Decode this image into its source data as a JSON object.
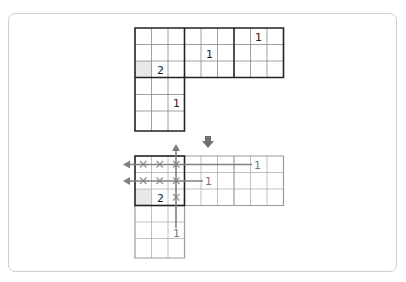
{
  "diagram": {
    "cell_size": 16.5,
    "colors": {
      "thick_line": "#222222",
      "thin_line": "#888888",
      "faded_line": "#aaaaaa",
      "shaded_cell": "#e8e8e8",
      "arrow": "#808080",
      "cross": "#9a9a9a"
    },
    "top_grid": {
      "clues": [
        {
          "row": 2,
          "col": 1,
          "value": "2"
        },
        {
          "row": 1,
          "col": 4,
          "value": "1"
        },
        {
          "row": 0,
          "col": 7,
          "value": "1"
        },
        {
          "row": 4,
          "col": 2,
          "value": "1"
        }
      ],
      "shaded": [
        {
          "row": 2,
          "col": 0
        }
      ]
    },
    "transition_arrow": "down-arrow",
    "bottom_grid": {
      "clues": [
        {
          "row": 2,
          "col": 1,
          "value": "2"
        }
      ],
      "shaded": [
        {
          "row": 2,
          "col": 0
        }
      ],
      "crosses": [
        {
          "row": 0,
          "col": 0
        },
        {
          "row": 0,
          "col": 1
        },
        {
          "row": 0,
          "col": 2
        },
        {
          "row": 1,
          "col": 0
        },
        {
          "row": 1,
          "col": 1
        },
        {
          "row": 1,
          "col": 2
        },
        {
          "row": 2,
          "col": 2
        }
      ],
      "ray_labels": [
        {
          "id": "row0",
          "value": "1"
        },
        {
          "id": "row1",
          "value": "1"
        },
        {
          "id": "col2",
          "value": "1"
        }
      ]
    }
  }
}
